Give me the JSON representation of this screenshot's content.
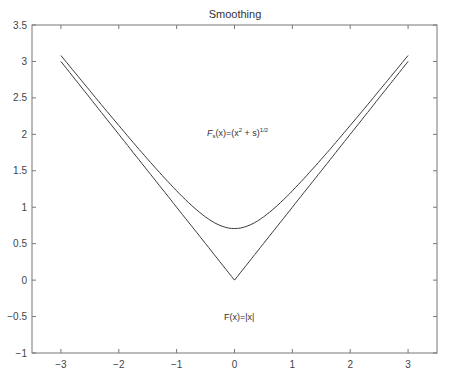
{
  "chart_data": {
    "type": "line",
    "title": "Smoothing",
    "xlabel": "",
    "ylabel": "",
    "xlim": [
      -3.5,
      3.5
    ],
    "ylim": [
      -1,
      3.5
    ],
    "grid": false,
    "legend": null,
    "x_ticks": [
      -3,
      -2,
      -1,
      0,
      1,
      2,
      3
    ],
    "x_tick_labels": [
      "−3",
      "−2",
      "−1",
      "0",
      "1",
      "2",
      "3"
    ],
    "y_ticks": [
      -1,
      -0.5,
      0,
      0.5,
      1,
      1.5,
      2,
      2.5,
      3,
      3.5
    ],
    "y_tick_labels": [
      "−1",
      "−0.5",
      "0",
      "0.5",
      "1",
      "1.5",
      "2",
      "2.5",
      "3",
      "3.5"
    ],
    "series": [
      {
        "name": "F(x)=|x|",
        "x": [
          -3,
          -2,
          -1,
          0,
          1,
          2,
          3
        ],
        "values": [
          3,
          2,
          1,
          0,
          1,
          2,
          3
        ]
      },
      {
        "name": "F_s(x)=(x^2 + s)^(1/2)",
        "s": 0.5,
        "x": [
          -3,
          -2,
          -1,
          -0.5,
          0,
          0.5,
          1,
          2,
          3
        ],
        "values": [
          3.08,
          2.12,
          1.22,
          0.87,
          0.71,
          0.87,
          1.22,
          2.12,
          3.08
        ]
      }
    ],
    "annotations": [
      {
        "text_main": "F",
        "text_sub": "s",
        "text_rest": "(x)=(x",
        "text_sup": "2",
        "text_rest2": " + s)",
        "text_sup2": "1/2",
        "x": 0,
        "y": 2.0
      },
      {
        "text": "F(x)=|x|",
        "x": 0,
        "y": -0.5
      }
    ],
    "line_color": "#3a3a3a"
  }
}
